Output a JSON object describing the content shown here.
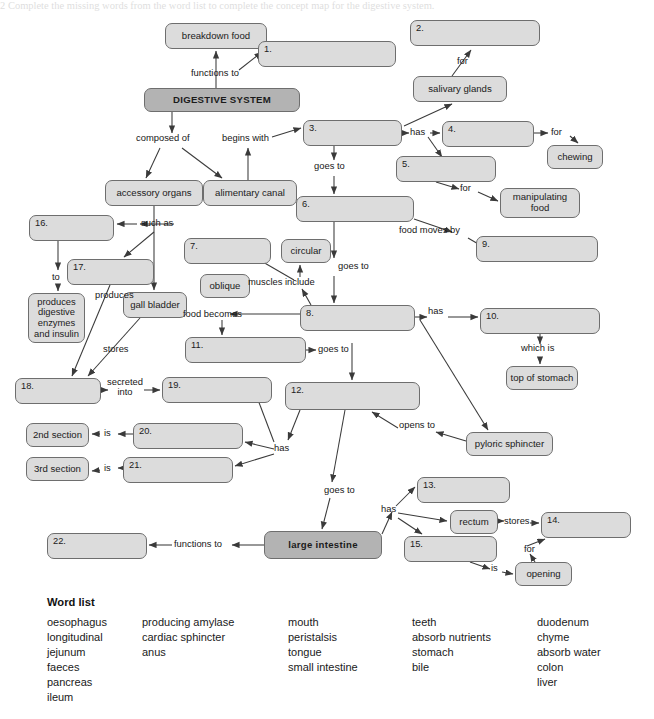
{
  "header": {
    "cropped_line": "2    Complete the missing words from the word list to complete the concept map for the digestive system."
  },
  "diagram": {
    "nodes": [
      {
        "id": "breakdown_food",
        "label": "breakdown food",
        "style": "light",
        "x": 165,
        "y": 23,
        "w": 102,
        "h": 26
      },
      {
        "id": "q1",
        "label": "1.",
        "style": "blank",
        "x": 258,
        "y": 41,
        "w": 138,
        "h": 26
      },
      {
        "id": "q2",
        "label": "2.",
        "style": "blank",
        "x": 410,
        "y": 20,
        "w": 130,
        "h": 26
      },
      {
        "id": "digestive_system",
        "label": "DIGESTIVE SYSTEM",
        "style": "dark",
        "x": 144,
        "y": 88,
        "w": 156,
        "h": 24
      },
      {
        "id": "salivary_glands",
        "label": "salivary glands",
        "style": "light",
        "x": 413,
        "y": 76,
        "w": 94,
        "h": 26
      },
      {
        "id": "q3",
        "label": "3.",
        "style": "blank",
        "x": 303,
        "y": 120,
        "w": 99,
        "h": 26
      },
      {
        "id": "q4",
        "label": "4.",
        "style": "blank",
        "x": 442,
        "y": 121,
        "w": 92,
        "h": 26
      },
      {
        "id": "chewing",
        "label": "chewing",
        "style": "light",
        "x": 547,
        "y": 145,
        "w": 56,
        "h": 24
      },
      {
        "id": "q5",
        "label": "5.",
        "style": "blank",
        "x": 396,
        "y": 156,
        "w": 100,
        "h": 26
      },
      {
        "id": "manipulating_food",
        "label": "manipulating food",
        "style": "light",
        "x": 500,
        "y": 188,
        "w": 80,
        "h": 30
      },
      {
        "id": "accessory_organs",
        "label": "accessory organs",
        "style": "light",
        "x": 105,
        "y": 180,
        "w": 98,
        "h": 26
      },
      {
        "id": "alimentary_canal",
        "label": "alimentary canal",
        "style": "light",
        "x": 203,
        "y": 180,
        "w": 94,
        "h": 26
      },
      {
        "id": "q6",
        "label": "6.",
        "style": "blank",
        "x": 296,
        "y": 196,
        "w": 118,
        "h": 26
      },
      {
        "id": "q9",
        "label": "9.",
        "style": "blank",
        "x": 476,
        "y": 236,
        "w": 122,
        "h": 26
      },
      {
        "id": "q16",
        "label": "16.",
        "style": "blank",
        "x": 29,
        "y": 215,
        "w": 85,
        "h": 26
      },
      {
        "id": "q7",
        "label": "7.",
        "style": "blank",
        "x": 184,
        "y": 238,
        "w": 87,
        "h": 26
      },
      {
        "id": "circular",
        "label": "circular",
        "style": "light",
        "x": 281,
        "y": 239,
        "w": 50,
        "h": 24
      },
      {
        "id": "q17",
        "label": "17.",
        "style": "blank",
        "x": 67,
        "y": 259,
        "w": 87,
        "h": 26
      },
      {
        "id": "oblique",
        "label": "oblique",
        "style": "light",
        "x": 200,
        "y": 274,
        "w": 50,
        "h": 24
      },
      {
        "id": "produces_enzymes",
        "label": "produces digestive enzymes and insulin",
        "style": "light",
        "x": 28,
        "y": 293,
        "w": 57,
        "h": 50
      },
      {
        "id": "gall_bladder",
        "label": "gall bladder",
        "style": "light",
        "x": 123,
        "y": 292,
        "w": 64,
        "h": 26
      },
      {
        "id": "q8",
        "label": "8.",
        "style": "blank",
        "x": 300,
        "y": 305,
        "w": 115,
        "h": 26
      },
      {
        "id": "q10",
        "label": "10.",
        "style": "blank",
        "x": 480,
        "y": 308,
        "w": 120,
        "h": 26
      },
      {
        "id": "q11",
        "label": "11.",
        "style": "blank",
        "x": 185,
        "y": 337,
        "w": 121,
        "h": 26
      },
      {
        "id": "top_of_stomach",
        "label": "top of stomach",
        "style": "light",
        "x": 506,
        "y": 366,
        "w": 72,
        "h": 24
      },
      {
        "id": "q18",
        "label": "18.",
        "style": "blank",
        "x": 15,
        "y": 378,
        "w": 86,
        "h": 26
      },
      {
        "id": "q19",
        "label": "19.",
        "style": "blank",
        "x": 162,
        "y": 377,
        "w": 110,
        "h": 26
      },
      {
        "id": "q12",
        "label": "12.",
        "style": "blank",
        "x": 285,
        "y": 382,
        "w": 135,
        "h": 28
      },
      {
        "id": "second_section",
        "label": "2nd section",
        "style": "light",
        "x": 26,
        "y": 423,
        "w": 63,
        "h": 24
      },
      {
        "id": "q20",
        "label": "20.",
        "style": "blank",
        "x": 133,
        "y": 423,
        "w": 110,
        "h": 26
      },
      {
        "id": "pyloric_sphincter",
        "label": "pyloric sphincter",
        "style": "light",
        "x": 466,
        "y": 432,
        "w": 87,
        "h": 24
      },
      {
        "id": "third_section",
        "label": "3rd section",
        "style": "light",
        "x": 26,
        "y": 457,
        "w": 63,
        "h": 24
      },
      {
        "id": "q21",
        "label": "21.",
        "style": "blank",
        "x": 123,
        "y": 457,
        "w": 110,
        "h": 26
      },
      {
        "id": "q13",
        "label": "13.",
        "style": "blank",
        "x": 417,
        "y": 477,
        "w": 93,
        "h": 26
      },
      {
        "id": "rectum",
        "label": "rectum",
        "style": "light",
        "x": 450,
        "y": 510,
        "w": 48,
        "h": 24
      },
      {
        "id": "q14",
        "label": "14.",
        "style": "blank",
        "x": 541,
        "y": 512,
        "w": 90,
        "h": 26
      },
      {
        "id": "q15",
        "label": "15.",
        "style": "blank",
        "x": 404,
        "y": 536,
        "w": 93,
        "h": 26
      },
      {
        "id": "large_intestine",
        "label": "large intestine",
        "style": "dark",
        "x": 264,
        "y": 531,
        "w": 118,
        "h": 28
      },
      {
        "id": "q22",
        "label": "22.",
        "style": "blank",
        "x": 47,
        "y": 533,
        "w": 100,
        "h": 26
      },
      {
        "id": "opening",
        "label": "opening",
        "style": "light",
        "x": 515,
        "y": 562,
        "w": 57,
        "h": 24
      }
    ],
    "edge_labels": [
      {
        "id": "functions_to_top",
        "text": "functions to",
        "x": 191,
        "y": 68
      },
      {
        "id": "for_salivary",
        "text": "for",
        "x": 457,
        "y": 56
      },
      {
        "id": "composed_of",
        "text": "composed of",
        "x": 140,
        "y": 138
      },
      {
        "id": "begins_with",
        "text": "begins with",
        "x": 226,
        "y": 138
      },
      {
        "id": "has_mouth",
        "text": "has",
        "x": 412,
        "y": 127
      },
      {
        "id": "for_chewing",
        "text": "for",
        "x": 553,
        "y": 129
      },
      {
        "id": "goes_to_3_6",
        "text": "goes to",
        "x": 317,
        "y": 166
      },
      {
        "id": "for_manipulating",
        "text": "for",
        "x": 462,
        "y": 188
      },
      {
        "id": "such_as",
        "text": "such as",
        "x": 144,
        "y": 224
      },
      {
        "id": "food_moves_by",
        "text": "food moves by",
        "x": 404,
        "y": 230
      },
      {
        "id": "muscles_include",
        "text": "muscles include",
        "x": 251,
        "y": 281
      },
      {
        "id": "to_pancreas",
        "text": "to",
        "x": 54,
        "y": 277
      },
      {
        "id": "produces",
        "text": "produces",
        "x": 100,
        "y": 292
      },
      {
        "id": "goes_to_6_8",
        "text": "goes to",
        "x": 340,
        "y": 266
      },
      {
        "id": "food_becomes",
        "text": "food becomes",
        "x": 185,
        "y": 313
      },
      {
        "id": "has_stomach",
        "text": "has",
        "x": 430,
        "y": 310
      },
      {
        "id": "stores",
        "text": "stores",
        "x": 107,
        "y": 348
      },
      {
        "id": "which_is",
        "text": "which is",
        "x": 523,
        "y": 347
      },
      {
        "id": "goes_to_11_12",
        "text": "goes to",
        "x": 320,
        "y": 347
      },
      {
        "id": "secreted_into",
        "text": "secreted into",
        "x": 110,
        "y": 381
      },
      {
        "id": "is_2nd",
        "text": "is",
        "x": 105,
        "y": 431
      },
      {
        "id": "has_small_int",
        "text": "has",
        "x": 277,
        "y": 447
      },
      {
        "id": "opens_to",
        "text": "opens to",
        "x": 400,
        "y": 424
      },
      {
        "id": "is_3rd",
        "text": "is",
        "x": 105,
        "y": 466
      },
      {
        "id": "goes_to_12_li",
        "text": "goes to",
        "x": 327,
        "y": 489
      },
      {
        "id": "has_large_int",
        "text": "has",
        "x": 383,
        "y": 509
      },
      {
        "id": "stores_rectum",
        "text": "stores",
        "x": 507,
        "y": 518
      },
      {
        "id": "functions_to_22",
        "text": "functions to",
        "x": 176,
        "y": 542
      },
      {
        "id": "for_faeces",
        "text": "for",
        "x": 527,
        "y": 548
      },
      {
        "id": "is_anus",
        "text": "is",
        "x": 493,
        "y": 567
      }
    ]
  },
  "word_list": {
    "title": "Word list",
    "columns": [
      {
        "id": "col1",
        "words": [
          "oesophagus",
          "longitudinal",
          "jejunum",
          "faeces",
          "pancreas",
          "ileum"
        ]
      },
      {
        "id": "col2",
        "words": [
          "producing amylase",
          "cardiac sphincter",
          "anus"
        ]
      },
      {
        "id": "col3",
        "words": [
          "mouth",
          "peristalsis",
          "tongue",
          "small intestine"
        ]
      },
      {
        "id": "col4",
        "words": [
          "teeth",
          "absorb nutrients",
          "stomach",
          "bile"
        ]
      },
      {
        "id": "col5",
        "words": [
          "duodenum",
          "chyme",
          "absorb water",
          "colon",
          "liver"
        ]
      }
    ]
  },
  "colors": {
    "node_light": "#dcdcdc",
    "node_dark": "#b3b3b3",
    "node_border": "#6e6e6e",
    "line": "#3a3a3a",
    "text": "#1b1b1b"
  }
}
